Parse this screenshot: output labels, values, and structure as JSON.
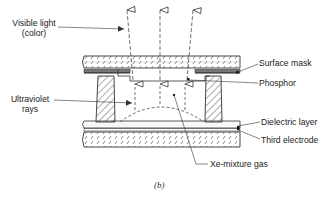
{
  "diagram": {
    "type": "cross-section",
    "caption": "(b)",
    "labels": {
      "visible_light_line1": "Visible light",
      "visible_light_line2": "(color)",
      "ultraviolet_line1": "Ultraviolet",
      "ultraviolet_line2": "rays",
      "surface_mask": "Surface mask",
      "phosphor": "Phosphor",
      "dielectric_layer": "Dielectric layer",
      "third_electrode": "Third electrode",
      "xe_gas": "Xe-mixture gas"
    },
    "components": [
      "top glass plate",
      "surface mask",
      "phosphor",
      "barrier ribs",
      "dielectric layer",
      "third electrode",
      "bottom glass plate",
      "discharge region (Xe-mixture gas)"
    ],
    "colors": {
      "line": "#333333",
      "background": "#ffffff",
      "mask": "#555555"
    }
  }
}
